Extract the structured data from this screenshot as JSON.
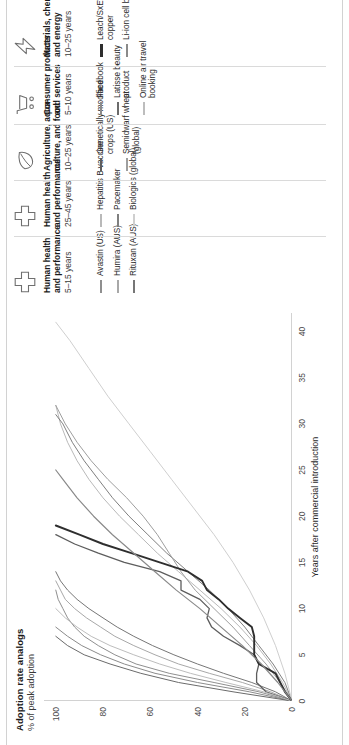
{
  "exhibit": {
    "title": "Adoption rate analogs",
    "subtitle": "% of peak adoption",
    "xaxis_title": "Years after commercial introduction"
  },
  "chart_data": {
    "type": "line",
    "title": "Adoption rate analogs",
    "subtitle": "% of peak adoption",
    "xlabel": "Years after commercial introduction",
    "ylabel": "% of peak adoption",
    "xlim": [
      0,
      42
    ],
    "ylim": [
      0,
      105
    ],
    "xticks": [
      0,
      5,
      10,
      15,
      20,
      25,
      30,
      35,
      40
    ],
    "yticks": [
      0,
      20,
      40,
      60,
      80,
      100
    ],
    "grid": false,
    "legend_position": "right",
    "series": [
      {
        "name": "Avastin (US)",
        "group": "Human health and performance 5-15 years",
        "color": "#8f8f8f",
        "width": 1.0,
        "x": [
          0,
          1,
          2,
          3,
          4,
          5,
          6,
          7,
          8,
          9,
          10,
          11,
          12
        ],
        "y": [
          0,
          14,
          33,
          52,
          66,
          75,
          82,
          88,
          92,
          95,
          97,
          99,
          100
        ]
      },
      {
        "name": "Humira (AUS)",
        "group": "Human health and performance 5-15 years",
        "color": "#a8a8a8",
        "width": 1.0,
        "x": [
          0,
          1,
          2,
          3,
          4,
          5,
          6,
          7,
          8,
          9,
          10,
          11,
          12,
          13
        ],
        "y": [
          0,
          9,
          21,
          35,
          48,
          58,
          67,
          75,
          81,
          87,
          92,
          96,
          98,
          100
        ]
      },
      {
        "name": "Rituxan (AUS)",
        "group": "Human health and performance 5-15 years",
        "color": "#767676",
        "width": 1.0,
        "x": [
          0,
          1,
          2,
          3,
          4,
          5,
          6,
          7,
          8,
          9,
          10,
          11,
          12,
          13,
          14
        ],
        "y": [
          0,
          7,
          17,
          29,
          40,
          50,
          59,
          67,
          74,
          80,
          86,
          91,
          95,
          98,
          100
        ]
      },
      {
        "name": "Hepatitis B vaccine",
        "group": "Human health and performance 25-45 years",
        "color": "#b9b9b9",
        "width": 1.0,
        "x": [
          0,
          2,
          4,
          6,
          8,
          10,
          12,
          14,
          16,
          18,
          20,
          22,
          24,
          26,
          28,
          30,
          32
        ],
        "y": [
          0,
          4,
          9,
          15,
          22,
          30,
          39,
          48,
          57,
          65,
          73,
          80,
          86,
          91,
          95,
          98,
          100
        ]
      },
      {
        "name": "Pacemaker",
        "group": "Human health and performance 25-45 years",
        "color": "#7f7f7f",
        "width": 1.0,
        "x": [
          0,
          2,
          4,
          6,
          8,
          10,
          12,
          14,
          16,
          18,
          20,
          22,
          24,
          26,
          28,
          30,
          31
        ],
        "y": [
          0,
          3,
          8,
          14,
          20,
          27,
          35,
          44,
          53,
          61,
          69,
          76,
          82,
          88,
          93,
          97,
          100
        ]
      },
      {
        "name": "Biologics (global)",
        "group": "Human health and performance 25-45 years",
        "color": "#cfcfcf",
        "width": 1.0,
        "x": [
          0,
          3,
          6,
          9,
          12,
          15,
          18,
          21,
          24,
          27,
          30,
          33,
          36,
          39,
          41
        ],
        "y": [
          0,
          3,
          7,
          12,
          18,
          25,
          33,
          42,
          51,
          60,
          69,
          78,
          86,
          94,
          100
        ]
      },
      {
        "name": "Genetically modified crops (US)",
        "group": "Agriculture, aquaculture, and food 10-25 years",
        "color": "#5d5d5d",
        "width": 1.3,
        "x": [
          0,
          1,
          2,
          3,
          4,
          5,
          6,
          7,
          8,
          9,
          10,
          11,
          12,
          13,
          14,
          15,
          16,
          17,
          18
        ],
        "y": [
          0,
          11,
          15,
          15,
          14,
          16,
          22,
          29,
          34,
          36,
          35,
          39,
          47,
          47,
          56,
          71,
          82,
          92,
          100
        ]
      },
      {
        "name": "Semidwarf wheat (global)",
        "group": "Agriculture, aquaculture, and food 10-25 years",
        "color": "#9e9e9e",
        "width": 1.0,
        "x": [
          0,
          2,
          4,
          6,
          8,
          10,
          12,
          14,
          16,
          18,
          20,
          22,
          24,
          26,
          28,
          30,
          32
        ],
        "y": [
          0,
          5,
          11,
          18,
          25,
          33,
          41,
          47,
          52,
          57,
          63,
          70,
          78,
          85,
          91,
          96,
          100
        ]
      },
      {
        "name": "Facebook",
        "group": "Consumer products and services 5-10 years",
        "color": "#8b8b8b",
        "width": 1.0,
        "x": [
          0,
          1,
          2,
          3,
          4,
          5,
          6,
          7,
          8
        ],
        "y": [
          0,
          18,
          40,
          58,
          71,
          81,
          89,
          95,
          100
        ]
      },
      {
        "name": "Latisse beauty product",
        "group": "Consumer products and services 5-10 years",
        "color": "#6b6b6b",
        "width": 1.0,
        "x": [
          0,
          1,
          2,
          3,
          4,
          5,
          6,
          7
        ],
        "y": [
          0,
          25,
          48,
          64,
          77,
          88,
          95,
          100
        ]
      },
      {
        "name": "Online air travel booking",
        "group": "Consumer products and services 5-10 years",
        "color": "#bdbdbd",
        "width": 1.0,
        "x": [
          0,
          1,
          2,
          3,
          4,
          5,
          6,
          7,
          8,
          9,
          10
        ],
        "y": [
          0,
          12,
          28,
          43,
          56,
          67,
          77,
          85,
          91,
          96,
          100
        ]
      },
      {
        "name": "Leach/SxEW copper",
        "group": "Materials, chemicals, and energy 10-25 years",
        "color": "#2e2e2e",
        "width": 1.9,
        "x": [
          0,
          1,
          2,
          3,
          4,
          5,
          6,
          7,
          8,
          9,
          10,
          11,
          12,
          13,
          14,
          15,
          16,
          17,
          18,
          19
        ],
        "y": [
          0,
          3,
          5,
          7,
          14,
          16,
          16,
          16,
          17,
          22,
          27,
          31,
          36,
          38,
          44,
          56,
          68,
          80,
          90,
          100
        ]
      },
      {
        "name": "Li-ion cell batteries",
        "group": "Materials, chemicals, and energy 10-25 years",
        "color": "#8a8a8a",
        "width": 1.2,
        "x": [
          0,
          2,
          4,
          6,
          8,
          10,
          12,
          14,
          16,
          18,
          20,
          22,
          24,
          25
        ],
        "y": [
          0,
          6,
          13,
          21,
          30,
          39,
          49,
          58,
          67,
          76,
          84,
          91,
          97,
          100
        ]
      }
    ]
  },
  "legend": {
    "groups": [
      {
        "icon": "medical-cross-icon",
        "title": "Human health",
        "title2": "and performance",
        "years": "5–15 years",
        "items": [
          {
            "label": "Avastin (US)",
            "color": "#8f8f8f",
            "thick": false
          },
          {
            "label": "Humira (AUS)",
            "color": "#a8a8a8",
            "thick": false
          },
          {
            "label": "Rituxan (AUS)",
            "color": "#767676",
            "thick": false
          }
        ]
      },
      {
        "icon": "medical-cross-icon",
        "title": "Human health",
        "title2": "and performance",
        "years": "25–45 years",
        "items": [
          {
            "label": "Hepatitis B vaccine",
            "color": "#b9b9b9",
            "thick": false
          },
          {
            "label": "Pacemaker",
            "color": "#7f7f7f",
            "thick": false
          },
          {
            "label": "Biologics (global)",
            "color": "#cfcfcf",
            "thick": false
          }
        ]
      },
      {
        "icon": "leaf-icon",
        "title": "Agriculture, aqua-",
        "title2": "culture, and food",
        "years": "10–25 years",
        "items": [
          {
            "label": "Genetically modified crops (US)",
            "color": "#5d5d5d",
            "thick": false
          },
          {
            "label": "Semidwarf wheat (global)",
            "color": "#9e9e9e",
            "thick": false
          }
        ]
      },
      {
        "icon": "shopping-cart-icon",
        "title": "Consumer products",
        "title2": "and services",
        "years": "5–10 years",
        "items": [
          {
            "label": "Facebook",
            "color": "#8b8b8b",
            "thick": false
          },
          {
            "label": "Latisse beauty product",
            "color": "#6b6b6b",
            "thick": false
          },
          {
            "label": "Online air travel booking",
            "color": "#bdbdbd",
            "thick": false
          }
        ]
      },
      {
        "icon": "lightning-bolt-icon",
        "title": "Materials, chemicals,",
        "title2": "and energy",
        "years": "10–25 years",
        "items": [
          {
            "label": "Leach/SxEW copper",
            "color": "#2e2e2e",
            "thick": true
          },
          {
            "label": "Li-ion cell batteries",
            "color": "#8a8a8a",
            "thick": false
          }
        ]
      }
    ]
  }
}
